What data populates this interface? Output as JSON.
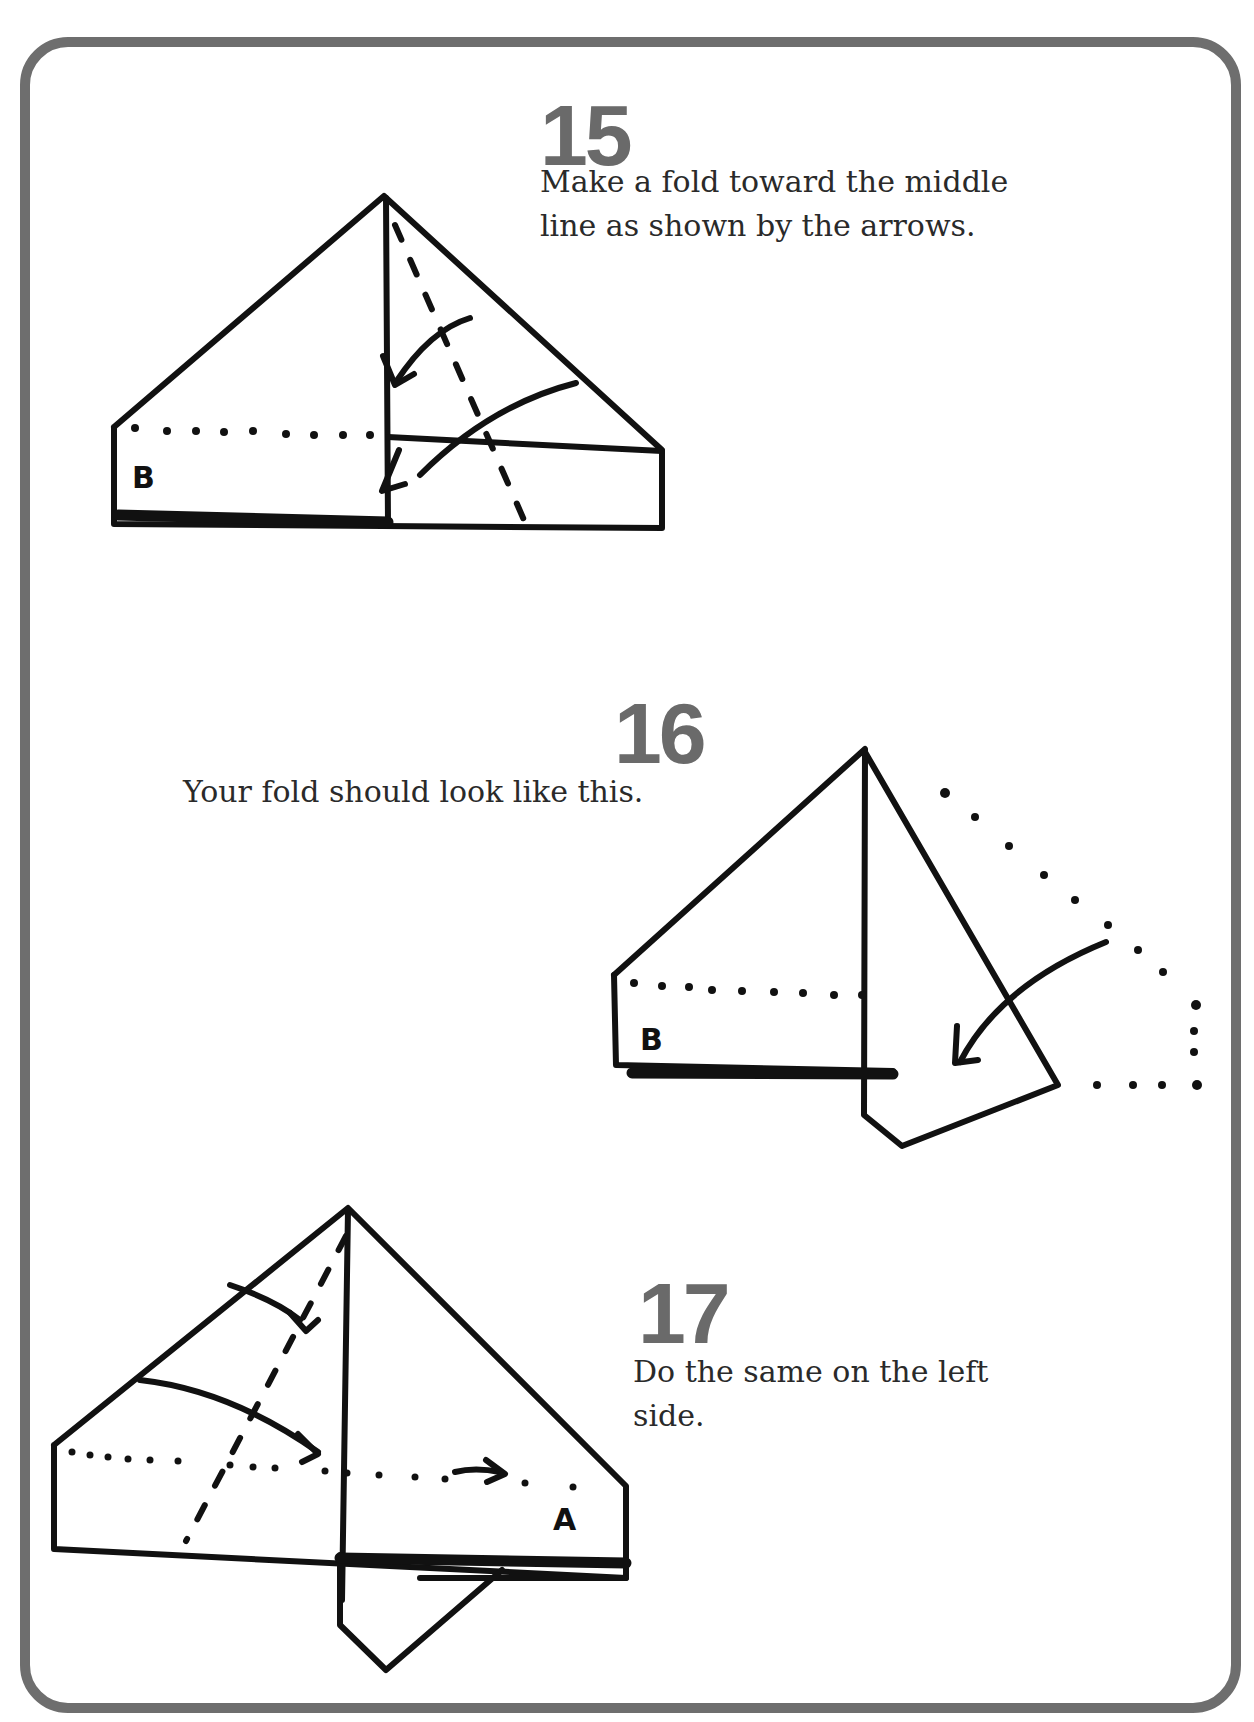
{
  "steps": [
    {
      "number": "15",
      "text": "Make a fold toward the middle\nline as shown by the arrows.",
      "diagram": {
        "label": "B"
      }
    },
    {
      "number": "16",
      "text": "Your fold should look like this.",
      "diagram": {
        "label": "B"
      }
    },
    {
      "number": "17",
      "text": "Do the same on the left\nside.",
      "diagram": {
        "label": "A"
      }
    }
  ],
  "colors": {
    "border": "#6e6e6e",
    "step_number": "#6a6a6a",
    "ink": "#111111"
  }
}
